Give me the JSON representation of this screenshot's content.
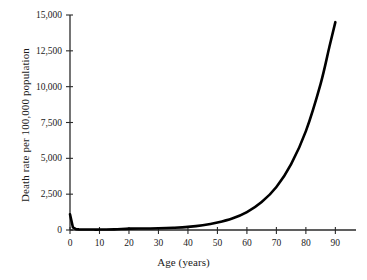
{
  "chart_data": {
    "type": "line",
    "title": "",
    "xlabel": "Age (years)",
    "ylabel": "Death rate per 100,000 population",
    "xlim": [
      0,
      97
    ],
    "ylim": [
      0,
      15000
    ],
    "grid": false,
    "legend": null,
    "xticks": [
      0,
      10,
      20,
      30,
      40,
      50,
      60,
      70,
      80,
      90
    ],
    "xtick_labels": [
      "0",
      "10",
      "20",
      "30",
      "40",
      "50",
      "60",
      "70",
      "80",
      "90"
    ],
    "yticks": [
      0,
      2500,
      5000,
      7500,
      10000,
      12500,
      15000
    ],
    "ytick_labels": [
      "0",
      "2,500",
      "5,000",
      "7,500",
      "10,000",
      "12,500",
      "15,000"
    ],
    "line_color": "#000000",
    "line_width": 2.6,
    "series": [
      {
        "name": "Death rate by age",
        "x": [
          0,
          1,
          2,
          3,
          5,
          8,
          10,
          15,
          20,
          25,
          30,
          35,
          40,
          45,
          50,
          55,
          60,
          65,
          70,
          75,
          80,
          85,
          88,
          90
        ],
        "values": [
          1100,
          180,
          60,
          45,
          35,
          30,
          30,
          45,
          95,
          105,
          120,
          155,
          215,
          330,
          520,
          800,
          1250,
          1950,
          3000,
          4600,
          6900,
          10200,
          12800,
          14500
        ]
      }
    ]
  }
}
